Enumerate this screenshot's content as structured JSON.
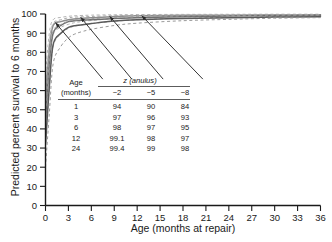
{
  "chart_data": {
    "type": "line",
    "title": "",
    "xlabel": "Age (months at repair)",
    "ylabel": "Predicted percent survival to 6 months",
    "xlim": [
      0,
      36
    ],
    "ylim": [
      0,
      100
    ],
    "xticks": [
      0,
      3,
      6,
      9,
      12,
      15,
      18,
      21,
      24,
      27,
      30,
      33,
      36
    ],
    "yticks": [
      0,
      10,
      20,
      30,
      40,
      50,
      60,
      70,
      80,
      90,
      100
    ],
    "grid": false,
    "legend_position": "none",
    "x": [
      0,
      0.5,
      1,
      2,
      3,
      4,
      6,
      9,
      12,
      18,
      24,
      30,
      36
    ],
    "series": [
      {
        "name": "z = -2",
        "style": "solid",
        "color": "#8c8c8c",
        "values": [
          55,
          82,
          94,
          96,
          97,
          97.5,
          98,
          98.7,
          99.1,
          99.3,
          99.4,
          99.5,
          99.6
        ]
      },
      {
        "name": "z = -2 upper bound",
        "style": "dashed",
        "color": "#b4b4b4",
        "values": [
          68,
          90,
          97,
          98.2,
          98.8,
          99.1,
          99.4,
          99.6,
          99.7,
          99.8,
          99.85,
          99.9,
          99.9
        ]
      },
      {
        "name": "z = -2 lower bound",
        "style": "dashed",
        "color": "#b4b4b4",
        "values": [
          40,
          72,
          89,
          93,
          94.6,
          95.6,
          96.6,
          97.6,
          98.2,
          98.7,
          99.0,
          99.2,
          99.3
        ]
      },
      {
        "name": "z = -5",
        "style": "solid",
        "color": "#6e6e6e",
        "values": [
          44,
          74,
          90,
          94,
          96,
          96.6,
          97,
          97.6,
          98,
          98.6,
          99,
          99.2,
          99.3
        ]
      },
      {
        "name": "z = -5 upper bound",
        "style": "dashed",
        "color": "#a8a8a8",
        "values": [
          58,
          85,
          95,
          97,
          98,
          98.4,
          98.7,
          99.1,
          99.3,
          99.5,
          99.6,
          99.7,
          99.75
        ]
      },
      {
        "name": "z = -5 lower bound",
        "style": "dashed",
        "color": "#a8a8a8",
        "values": [
          30,
          62,
          83,
          89.5,
          92.5,
          93.8,
          95.0,
          96.2,
          97.0,
          97.8,
          98.3,
          98.7,
          98.9
        ]
      },
      {
        "name": "z = -8",
        "style": "solid",
        "color": "#595959",
        "values": [
          32,
          62,
          84,
          90,
          93,
          94,
          95,
          96.3,
          97,
          97.7,
          98,
          98.4,
          98.6
        ]
      },
      {
        "name": "z = -8 upper bound",
        "style": "dashed",
        "color": "#9a9a9a",
        "values": [
          46,
          76,
          91,
          94.5,
          96.2,
          96.9,
          97.5,
          98.2,
          98.6,
          99.0,
          99.2,
          99.35,
          99.45
        ]
      },
      {
        "name": "z = -8 lower bound",
        "style": "dashed",
        "color": "#9a9a9a",
        "values": [
          20,
          48,
          74,
          83,
          87.5,
          89.8,
          92.0,
          94.0,
          95.2,
          96.5,
          97.2,
          97.8,
          98.1
        ]
      }
    ],
    "annotations": [
      {
        "label": "arrow-1",
        "tip_x": 1.3,
        "tip_y": 95.5,
        "tail_x": 7.5,
        "tail_y": 66
      },
      {
        "label": "arrow-2",
        "tip_x": 4.6,
        "tip_y": 98.3,
        "tail_x": 11.3,
        "tail_y": 66
      },
      {
        "label": "arrow-3",
        "tip_x": 8.4,
        "tip_y": 98.8,
        "tail_x": 15.4,
        "tail_y": 66
      },
      {
        "label": "arrow-4",
        "tip_x": 12.6,
        "tip_y": 99.1,
        "tail_x": 20.6,
        "tail_y": 66
      }
    ]
  },
  "inset_table": {
    "row_header_line1": "Age",
    "row_header_line2": "(months)",
    "group_header": "z (anulus)",
    "columns": [
      "−2",
      "−5",
      "−8"
    ],
    "rows": [
      {
        "age": "1",
        "values": [
          "94",
          "90",
          "84"
        ]
      },
      {
        "age": "3",
        "values": [
          "97",
          "96",
          "93"
        ]
      },
      {
        "age": "6",
        "values": [
          "98",
          "97",
          "95"
        ]
      },
      {
        "age": "12",
        "values": [
          "99.1",
          "98",
          "97"
        ]
      },
      {
        "age": "24",
        "values": [
          "99.4",
          "99",
          "98"
        ]
      }
    ]
  }
}
